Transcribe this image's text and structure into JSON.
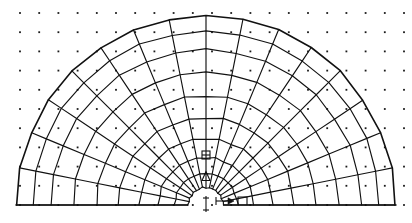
{
  "figure": {
    "kind": "fem-mesh-half-annulus",
    "background_color": "#ffffff",
    "line_color": "#111111",
    "dot_color": "#1a1a1a"
  },
  "geometry": {
    "center_x": 206,
    "center_y": 205,
    "inner_radius": 18,
    "outer_radius": 190,
    "angular_divisions": 16,
    "angle_start_deg": 0,
    "angle_end_deg": 180,
    "ring_radii": [
      18,
      32,
      48,
      67,
      88,
      110,
      133,
      156,
      174,
      190
    ],
    "ring_count": 9
  },
  "dot_grid": {
    "visible": true,
    "origin_x": 20,
    "origin_y": 13,
    "spacing_x": 19.2,
    "spacing_y": 19.2,
    "columns": 21,
    "rows": 11,
    "dot_size": 1.8
  },
  "annotations": {
    "support_square": {
      "name": "roller-support-symbol",
      "x": 206,
      "y": 155,
      "width": 8,
      "height": 8
    },
    "support_triangle": {
      "name": "pin-support-symbol",
      "x": 206,
      "y": 176,
      "width": 8,
      "height": 9
    },
    "center_tick": {
      "name": "center-axis-tick",
      "x": 206,
      "y": 205
    },
    "load_arrow": {
      "name": "load-arrow",
      "x1": 216,
      "y1": 201,
      "x2": 234,
      "y2": 201
    },
    "radius_marker": {
      "name": "radius-dimension-marker",
      "x": 243,
      "y": 197
    },
    "labels": []
  },
  "baseline": {
    "y": 205,
    "x_left": 16,
    "x_right": 396
  }
}
